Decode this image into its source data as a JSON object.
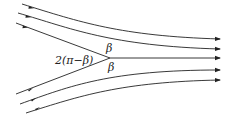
{
  "diagram": {
    "labels": {
      "apex_angle": "2(π−β)",
      "beta_upper": "β",
      "beta_lower": "β"
    },
    "colors": {
      "line": "#222222",
      "background": "#ffffff"
    },
    "streamlines": [
      {
        "id": "top-outer",
        "path": "M22,4 C80,22 120,36 220,39"
      },
      {
        "id": "top-middle",
        "path": "M18,13 C70,28 110,46 220,49"
      },
      {
        "id": "top-inner",
        "path": "M16,23 L110,58"
      },
      {
        "id": "center-out",
        "path": "M110,58 L220,58"
      },
      {
        "id": "bot-inner",
        "path": "M16,94 L110,58"
      },
      {
        "id": "bot-middle",
        "path": "M20,104 C70,86 110,70 220,70"
      },
      {
        "id": "bot-outer",
        "path": "M26,113 C80,96 120,82 220,80"
      }
    ]
  }
}
